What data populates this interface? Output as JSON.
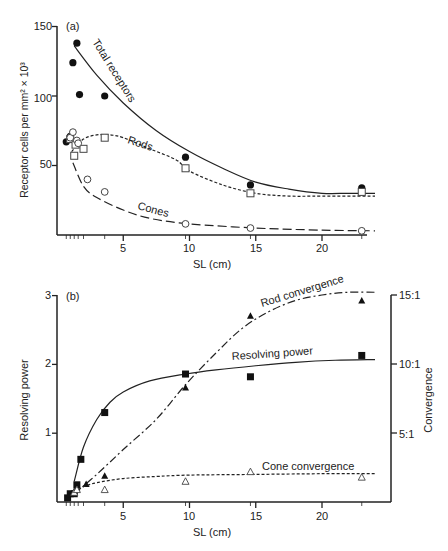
{
  "chart_data": [
    {
      "type": "scatter",
      "panel_label": "(a)",
      "title": "",
      "xlabel": "SL (cm)",
      "ylabel": "Receptor cells per mm² × 10³",
      "xlim": [
        0,
        25
      ],
      "ylim": [
        0,
        150
      ],
      "xticks": [
        5,
        10,
        15,
        20
      ],
      "yticks": [
        50,
        100,
        150
      ],
      "grid": false,
      "series": [
        {
          "name": "Total receptors",
          "marker": "filled-circle",
          "line": "solid",
          "x": [
            0.7,
            1.0,
            1.2,
            1.5,
            1.7,
            3.6,
            9.7,
            14.6,
            23.0
          ],
          "y": [
            67,
            71,
            124,
            138,
            101,
            100,
            56,
            36,
            34
          ],
          "curve_x": [
            1.3,
            3,
            5,
            7.5,
            10,
            12.5,
            15,
            17.5,
            20,
            22,
            24
          ],
          "curve_y": [
            136,
            115,
            95,
            75,
            60,
            48,
            38,
            33,
            30,
            30,
            30
          ]
        },
        {
          "name": "Rods",
          "marker": "open-square",
          "line": "dotted",
          "x": [
            1.0,
            1.3,
            1.4,
            2.0,
            3.6,
            9.7,
            14.6,
            23.0
          ],
          "y": [
            69,
            57,
            65,
            62,
            70,
            48,
            30,
            31
          ],
          "curve_x": [
            1.1,
            2,
            3,
            4,
            5,
            7,
            9,
            10,
            12.5,
            15,
            17.5,
            20,
            24
          ],
          "curve_y": [
            60,
            69,
            72,
            72,
            70,
            62,
            54,
            46,
            36,
            30,
            28,
            28,
            28
          ]
        },
        {
          "name": "Cones",
          "marker": "open-circle",
          "line": "dashed",
          "x": [
            1.0,
            1.2,
            1.5,
            1.6,
            2.3,
            3.6,
            9.7,
            14.6,
            23.0
          ],
          "y": [
            70,
            74,
            68,
            66,
            40,
            31,
            8,
            5,
            3
          ],
          "curve_x": [
            1.2,
            2,
            3,
            5,
            7,
            10,
            15,
            20,
            24
          ],
          "curve_y": [
            52,
            35,
            27,
            18,
            12,
            8,
            5,
            3.5,
            3
          ]
        }
      ],
      "annotations": [
        "Total receptors",
        "Rods",
        "Cones"
      ]
    },
    {
      "type": "scatter",
      "panel_label": "(b)",
      "title": "",
      "xlabel": "SL (cm)",
      "ylabel": "Resolving power",
      "y2label": "Convergence",
      "xlim": [
        0,
        25
      ],
      "ylim": [
        0,
        3
      ],
      "y2lim": [
        0,
        15
      ],
      "xticks": [
        5,
        10,
        15,
        20
      ],
      "yticks": [
        1,
        2,
        3
      ],
      "y2ticks": [
        "5:1",
        "10:1",
        "15:1"
      ],
      "grid": false,
      "series": [
        {
          "name": "Resolving power",
          "axis": "left",
          "marker": "filled-square",
          "line": "solid",
          "x": [
            0.8,
            1.0,
            1.3,
            1.5,
            1.8,
            3.6,
            9.7,
            14.6,
            23.0
          ],
          "y": [
            0.06,
            0.12,
            0.12,
            0.25,
            0.62,
            1.3,
            1.86,
            1.82,
            2.13
          ],
          "curve_x": [
            1.3,
            2,
            3,
            4,
            5,
            7,
            9.7,
            12,
            15,
            18,
            21,
            24
          ],
          "curve_y": [
            0.3,
            0.8,
            1.2,
            1.45,
            1.6,
            1.76,
            1.86,
            1.92,
            1.98,
            2.03,
            2.06,
            2.07
          ]
        },
        {
          "name": "Rod convergence",
          "axis": "right",
          "marker": "filled-triangle",
          "line": "dash-dot",
          "x": [
            1.3,
            1.5,
            2.2,
            3.6,
            9.7,
            14.6,
            23.0
          ],
          "y": [
            0.8,
            1.0,
            1.3,
            1.9,
            8.3,
            13.5,
            14.6
          ],
          "curve_x": [
            1.3,
            3,
            5,
            7.5,
            9.7,
            12,
            14,
            16,
            18,
            20,
            22,
            24
          ],
          "curve_y": [
            0.6,
            2.0,
            3.8,
            6.0,
            8.5,
            10.8,
            12.6,
            13.8,
            14.6,
            15.0,
            15.2,
            15.2
          ]
        },
        {
          "name": "Cone convergence",
          "axis": "right",
          "marker": "open-triangle",
          "line": "dotted",
          "x": [
            1.3,
            1.5,
            3.6,
            9.7,
            14.6,
            23.0
          ],
          "y": [
            0.7,
            0.9,
            0.9,
            1.5,
            2.2,
            1.8
          ],
          "curve_x": [
            1.3,
            2,
            3,
            5,
            7.5,
            10,
            15,
            20,
            24
          ],
          "curve_y": [
            0.7,
            1.1,
            1.4,
            1.7,
            1.85,
            1.95,
            2.0,
            2.05,
            2.05
          ]
        }
      ],
      "annotations": [
        "Rod convergence",
        "Resolving power",
        "Cone convergence"
      ]
    }
  ],
  "panels": {
    "a": {
      "label": "(a)",
      "xlabel": "SL (cm)",
      "ylabel": "Receptor cells per mm² × 10³",
      "yticks": [
        "50",
        "100",
        "150"
      ],
      "xticks": [
        "5",
        "10",
        "15",
        "20"
      ],
      "curve_labels": {
        "total": "Total receptors",
        "rods": "Rods",
        "cones": "Cones"
      }
    },
    "b": {
      "label": "(b)",
      "xlabel": "SL (cm)",
      "ylabel": "Resolving power",
      "y2label": "Convergence",
      "yticks": [
        "1",
        "2",
        "3"
      ],
      "y2ticks": [
        "5:1",
        "10:1",
        "15:1"
      ],
      "xticks": [
        "5",
        "10",
        "15",
        "20"
      ],
      "curve_labels": {
        "rod": "Rod convergence",
        "res": "Resolving power",
        "cone": "Cone convergence"
      }
    }
  }
}
